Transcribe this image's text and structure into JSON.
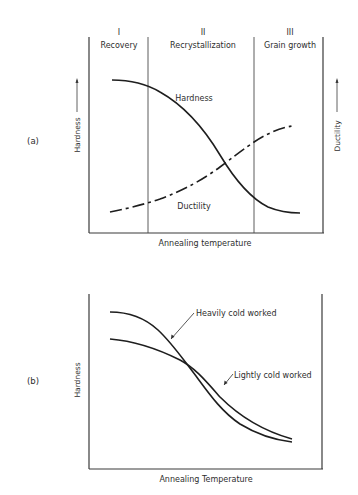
{
  "panel_a": {
    "tag": "(a)",
    "regions": [
      {
        "numeral": "I",
        "name": "Recovery"
      },
      {
        "numeral": "II",
        "name": "Recrystallization"
      },
      {
        "numeral": "III",
        "name": "Grain growth"
      }
    ],
    "y_left_label": "Hardness",
    "y_right_label": "Ductility",
    "x_label": "Annealing temperature",
    "curve_labels": {
      "hardness": "Hardness",
      "ductility": "Ductility"
    }
  },
  "panel_b": {
    "tag": "(b)",
    "y_label": "Hardness",
    "x_label": "Annealing Temperature",
    "curve_labels": {
      "heavy": "Heavily cold worked",
      "light": "Lightly cold worked"
    }
  },
  "colors": {
    "line": "#1e1e1e",
    "axis": "#3a3a3a",
    "text": "#2e2e2e",
    "background": "#ffffff"
  }
}
